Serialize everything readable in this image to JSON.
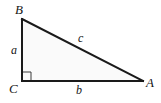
{
  "figure": {
    "type": "right-triangle-diagram",
    "background_color": "#ffffff",
    "interior_fill": "#fafafa",
    "stroke_color": "#1a1a1a",
    "stroke_width": 2,
    "vertices": [
      {
        "name": "B",
        "label": "B",
        "x": 22,
        "y": 19
      },
      {
        "name": "C",
        "label": "C",
        "x": 22,
        "y": 81
      },
      {
        "name": "A",
        "label": "A",
        "x": 143,
        "y": 81
      }
    ],
    "sides": [
      {
        "name": "a",
        "label": "a",
        "from": "B",
        "to": "C",
        "role": "vertical-leg"
      },
      {
        "name": "b",
        "label": "b",
        "from": "C",
        "to": "A",
        "role": "horizontal-leg"
      },
      {
        "name": "c",
        "label": "c",
        "from": "B",
        "to": "A",
        "role": "hypotenuse"
      }
    ],
    "right_angle": {
      "at_vertex": "C",
      "marker": "square",
      "size": 9,
      "stroke_color": "#3a3a3a"
    }
  }
}
